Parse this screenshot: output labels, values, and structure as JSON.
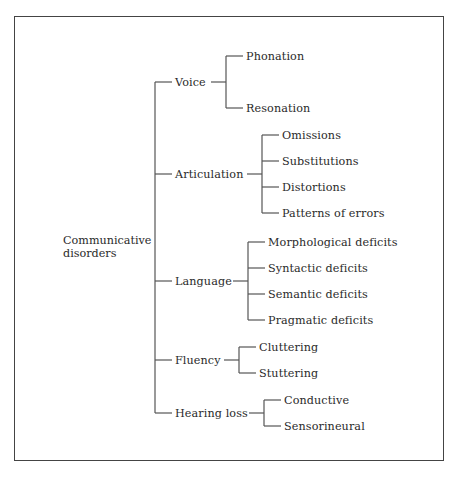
{
  "diagram": {
    "root": {
      "line1": "Communicative",
      "line2": "disorders"
    },
    "categories": [
      {
        "label": "Voice",
        "children": [
          "Phonation",
          "Resonation"
        ]
      },
      {
        "label": "Articulation",
        "children": [
          "Omissions",
          "Substitutions",
          "Distortions",
          "Patterns of errors"
        ]
      },
      {
        "label": "Language",
        "children": [
          "Morphological deficits",
          "Syntactic deficits",
          "Semantic deficits",
          "Pragmatic deficits"
        ]
      },
      {
        "label": "Fluency",
        "children": [
          "Cluttering",
          "Stuttering"
        ]
      },
      {
        "label": "Hearing loss",
        "children": [
          "Conductive",
          "Sensorineural"
        ]
      }
    ],
    "colors": {
      "line": "#555555",
      "text": "#2a2a2a",
      "border": "#444444",
      "background": "#ffffff"
    }
  }
}
